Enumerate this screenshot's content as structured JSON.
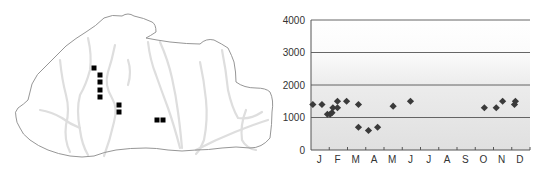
{
  "map": {
    "description": "Outline map of Bhutan with rivers",
    "outline_color": "#8a8a8a",
    "river_color": "#dcdcdc",
    "marker_color": "#000000",
    "markers": [
      {
        "x": 94,
        "y": 68
      },
      {
        "x": 100,
        "y": 75
      },
      {
        "x": 100,
        "y": 82
      },
      {
        "x": 100,
        "y": 90
      },
      {
        "x": 100,
        "y": 97
      },
      {
        "x": 119,
        "y": 105
      },
      {
        "x": 119,
        "y": 112
      },
      {
        "x": 157,
        "y": 120
      },
      {
        "x": 163,
        "y": 120
      }
    ]
  },
  "chart_data": {
    "type": "scatter",
    "title": "",
    "xlabel": "",
    "ylabel": "",
    "ylim": [
      0,
      4000
    ],
    "yticks": [
      "0",
      "1000",
      "2000",
      "3000",
      "4000"
    ],
    "categories": [
      "J",
      "F",
      "M",
      "A",
      "M",
      "J",
      "J",
      "A",
      "S",
      "O",
      "N",
      "D"
    ],
    "grid": true,
    "marker": "diamond",
    "marker_color": "#3a3a3a",
    "series": [
      {
        "name": "records",
        "points": [
          {
            "x": 0.1,
            "y": 1400
          },
          {
            "x": 0.6,
            "y": 1400
          },
          {
            "x": 0.9,
            "y": 1100
          },
          {
            "x": 1.05,
            "y": 1100
          },
          {
            "x": 1.15,
            "y": 1150
          },
          {
            "x": 1.2,
            "y": 1300
          },
          {
            "x": 1.45,
            "y": 1500
          },
          {
            "x": 1.45,
            "y": 1300
          },
          {
            "x": 1.95,
            "y": 1500
          },
          {
            "x": 2.6,
            "y": 1400
          },
          {
            "x": 2.6,
            "y": 700
          },
          {
            "x": 3.15,
            "y": 600
          },
          {
            "x": 3.65,
            "y": 700
          },
          {
            "x": 4.5,
            "y": 1350
          },
          {
            "x": 5.45,
            "y": 1500
          },
          {
            "x": 9.5,
            "y": 1300
          },
          {
            "x": 10.15,
            "y": 1300
          },
          {
            "x": 10.5,
            "y": 1500
          },
          {
            "x": 11.15,
            "y": 1400
          },
          {
            "x": 11.2,
            "y": 1500
          }
        ]
      }
    ]
  }
}
